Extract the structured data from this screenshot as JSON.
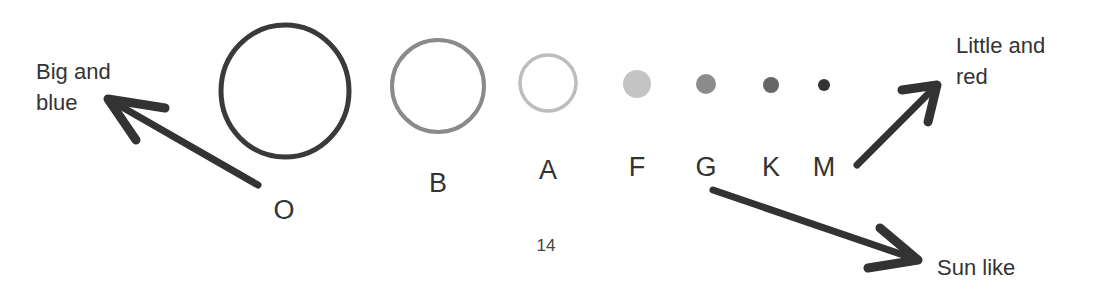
{
  "diagram": {
    "topic": "Stellar spectral classes",
    "colors": {
      "ink": "#333333"
    },
    "stars": [
      {
        "class": "O",
        "cx": 285,
        "cy": 91,
        "rx": 64,
        "ry": 66,
        "style": "ring",
        "color": "#3a3a3a",
        "stroke": 5,
        "label_x": 284,
        "label_y": 210
      },
      {
        "class": "B",
        "cx": 438,
        "cy": 86,
        "rx": 46,
        "ry": 46,
        "style": "ring",
        "color": "#8a8a8a",
        "stroke": 4,
        "label_x": 438,
        "label_y": 183
      },
      {
        "class": "A",
        "cx": 548,
        "cy": 83,
        "rx": 28,
        "ry": 28,
        "style": "ring",
        "color": "#bdbdbd",
        "stroke": 3.5,
        "label_x": 548,
        "label_y": 170
      },
      {
        "class": "F",
        "cx": 637,
        "cy": 84,
        "rx": 14,
        "ry": 14,
        "style": "filled",
        "color": "#c4c4c4",
        "label_x": 637,
        "label_y": 167
      },
      {
        "class": "G",
        "cx": 706,
        "cy": 84,
        "rx": 10,
        "ry": 10,
        "style": "filled",
        "color": "#8c8c8c",
        "label_x": 706,
        "label_y": 167
      },
      {
        "class": "K",
        "cx": 771,
        "cy": 85,
        "rx": 8,
        "ry": 8,
        "style": "filled",
        "color": "#666666",
        "label_x": 771,
        "label_y": 167
      },
      {
        "class": "M",
        "cx": 824,
        "cy": 85,
        "rx": 6,
        "ry": 6,
        "style": "filled",
        "color": "#333333",
        "label_x": 824,
        "label_y": 167
      }
    ],
    "annotations": [
      {
        "id": "big-and-blue",
        "lines": [
          "Big and",
          "blue"
        ],
        "x": 36,
        "y": 56,
        "points_from": "O"
      },
      {
        "id": "little-and-red",
        "lines": [
          "Little and",
          "red"
        ],
        "x": 956,
        "y": 30,
        "points_from": "M"
      },
      {
        "id": "sun-like",
        "lines": [
          "Sun like"
        ],
        "x": 937,
        "y": 252,
        "points_from": "G"
      }
    ],
    "arrows": [
      {
        "id": "arrow-o-to-big-blue",
        "shaft": [
          [
            258,
            185
          ],
          [
            108,
            99
          ]
        ],
        "head": [
          [
            165,
            108
          ],
          [
            108,
            99
          ],
          [
            136,
            140
          ]
        ]
      },
      {
        "id": "arrow-m-to-little-red",
        "shaft": [
          [
            857,
            165
          ],
          [
            937,
            85
          ]
        ],
        "head": [
          [
            902,
            90
          ],
          [
            937,
            85
          ],
          [
            928,
            122
          ]
        ]
      },
      {
        "id": "arrow-g-to-sun-like",
        "shaft": [
          [
            713,
            190
          ],
          [
            918,
            260
          ]
        ],
        "head": [
          [
            880,
            228
          ],
          [
            918,
            260
          ],
          [
            868,
            268
          ]
        ]
      }
    ]
  },
  "page_number": "14"
}
